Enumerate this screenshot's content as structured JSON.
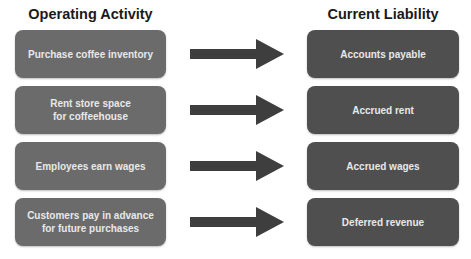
{
  "headers": {
    "left": "Operating Activity",
    "right": "Current Liability"
  },
  "rows": [
    {
      "activity": "Purchase coffee inventory",
      "liability": "Accounts payable"
    },
    {
      "activity": "Rent store space\nfor coffeehouse",
      "liability": "Accrued rent"
    },
    {
      "activity": "Employees earn wages",
      "liability": "Accrued wages"
    },
    {
      "activity": "Customers pay in advance\nfor future purchases",
      "liability": "Deferred revenue"
    }
  ],
  "colors": {
    "activity_box": "#6b6b6b",
    "liability_box": "#4f4f4f",
    "arrow": "#3e3e3e",
    "box_text": "#e8e8e8"
  },
  "icons": {
    "connector": "right-arrow-icon"
  }
}
